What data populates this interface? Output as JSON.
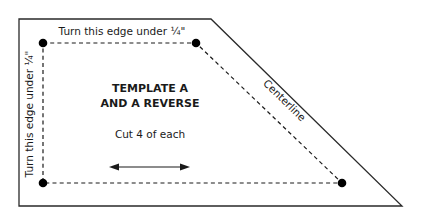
{
  "diagram": {
    "title_line1": "TEMPLATE A",
    "title_line2": "AND A REVERSE",
    "instruction": "Cut 4 of each",
    "top_edge_label": "Turn this edge under ¼\"",
    "left_edge_label": "Turn this edge under ¼\"",
    "diagonal_label": "Centerline",
    "grain_arrow": "double-headed-arrow",
    "colors": {
      "outline": "#2a2a2a",
      "dashed_line": "#1a1a1a",
      "dots": "#000000",
      "background": "#ffffff"
    },
    "shape": {
      "outer_polygon": [
        [
          19,
          19
        ],
        [
          211,
          19
        ],
        [
          402,
          206
        ],
        [
          19,
          206
        ]
      ],
      "seam_polygon": [
        [
          43,
          43
        ],
        [
          196,
          43
        ],
        [
          342,
          183
        ],
        [
          43,
          183
        ]
      ],
      "corner_dots": 4
    }
  }
}
